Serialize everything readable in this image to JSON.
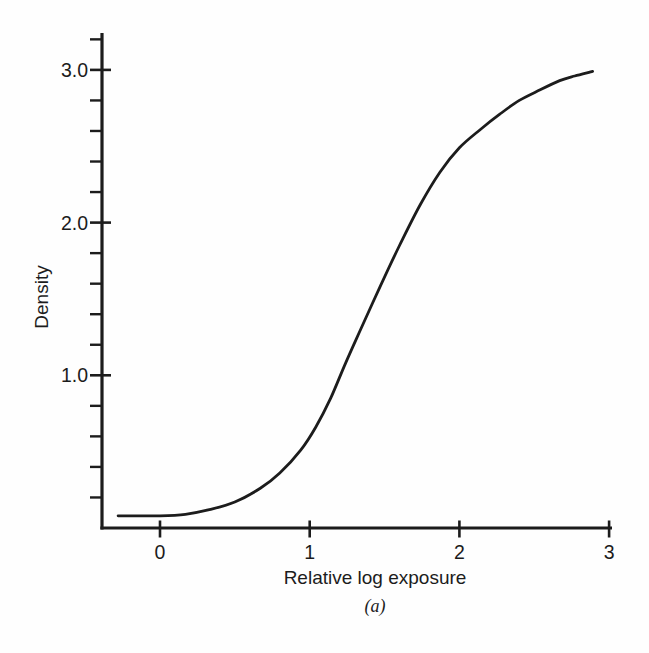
{
  "figure": {
    "caption": "(a)",
    "ink_color": "#1c1c1c",
    "background": "#fefefe"
  },
  "chart_data": {
    "type": "line",
    "title": "",
    "xlabel": "Relative log exposure",
    "ylabel": "Density",
    "xlim": [
      -0.39,
      3.02
    ],
    "ylim": [
      0,
      3.24
    ],
    "grid": false,
    "legend": "none",
    "x_ticks": [
      {
        "value": 0,
        "label": "0"
      },
      {
        "value": 1,
        "label": "1"
      },
      {
        "value": 2,
        "label": "2"
      },
      {
        "value": 3,
        "label": "3"
      }
    ],
    "y_major_ticks": [
      {
        "value": 1.0,
        "label": "1.0"
      },
      {
        "value": 2.0,
        "label": "2.0"
      },
      {
        "value": 3.0,
        "label": "3.0"
      }
    ],
    "y_minor_tick_values": [
      0.2,
      0.4,
      0.6,
      0.8,
      1.2,
      1.4,
      1.6,
      1.8,
      2.2,
      2.4,
      2.6,
      2.8,
      3.2
    ],
    "series": [
      {
        "name": "characteristic-curve",
        "points": [
          [
            -0.28,
            0.08
          ],
          [
            0.0,
            0.08
          ],
          [
            0.17,
            0.09
          ],
          [
            0.33,
            0.12
          ],
          [
            0.5,
            0.17
          ],
          [
            0.67,
            0.26
          ],
          [
            0.8,
            0.36
          ],
          [
            0.94,
            0.51
          ],
          [
            1.04,
            0.66
          ],
          [
            1.14,
            0.85
          ],
          [
            1.24,
            1.08
          ],
          [
            1.34,
            1.3
          ],
          [
            1.47,
            1.58
          ],
          [
            1.6,
            1.85
          ],
          [
            1.74,
            2.12
          ],
          [
            1.87,
            2.33
          ],
          [
            2.0,
            2.49
          ],
          [
            2.14,
            2.61
          ],
          [
            2.27,
            2.71
          ],
          [
            2.4,
            2.8
          ],
          [
            2.54,
            2.87
          ],
          [
            2.67,
            2.93
          ],
          [
            2.77,
            2.96
          ],
          [
            2.89,
            2.99
          ]
        ]
      }
    ]
  }
}
